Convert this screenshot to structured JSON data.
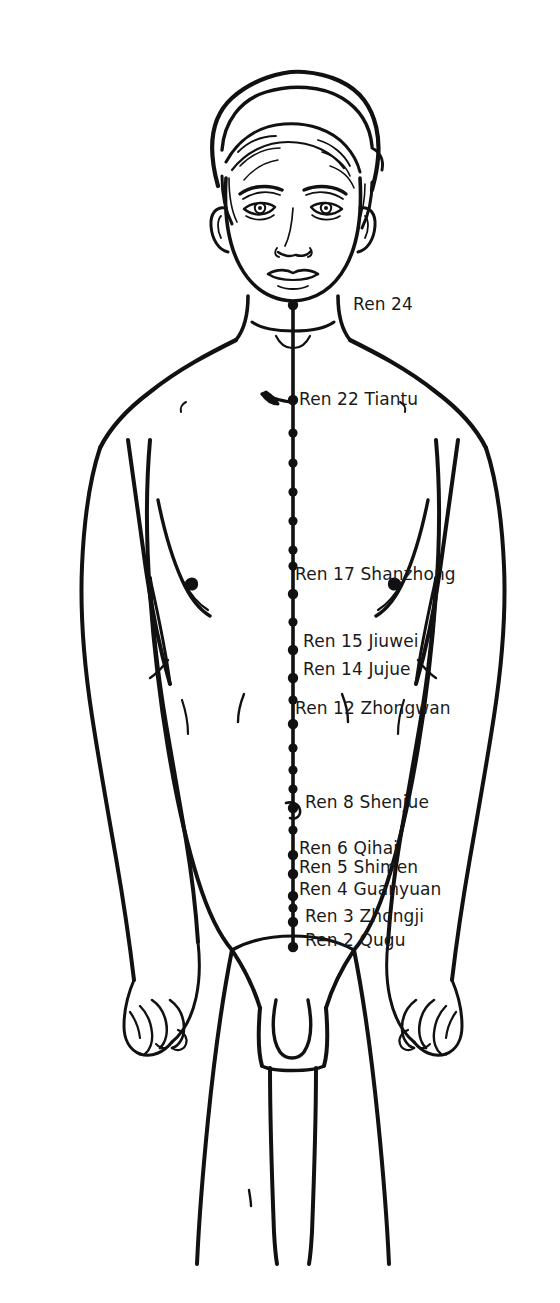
{
  "chart_data": {
    "type": "diagram",
    "meridian": "Ren",
    "background_color": "#ffffff",
    "ink_color": "#111111",
    "midline": {
      "x": 293,
      "y_top": 305,
      "y_bottom": 947,
      "description": "vertical Ren meridian line running from below the lower lip down the midline of the torso to the pubic bone"
    },
    "labeled_points": [
      {
        "id": "ren24",
        "label": "Ren 24",
        "number": 24,
        "name": "",
        "dot_x": 293,
        "dot_y": 305,
        "label_x": 353,
        "label_y": 296
      },
      {
        "id": "ren22",
        "label": "Ren 22 Tiantu",
        "number": 22,
        "name": "Tiantu",
        "dot_x": 293,
        "dot_y": 400,
        "label_x": 299,
        "label_y": 391
      },
      {
        "id": "ren17",
        "label": "Ren 17 Shanzhong",
        "number": 17,
        "name": "Shanzhong",
        "dot_x": 293,
        "dot_y": 594,
        "label_x": 295,
        "label_y": 566
      },
      {
        "id": "ren15",
        "label": "Ren 15 Jiuwei",
        "number": 15,
        "name": "Jiuwei",
        "dot_x": 293,
        "dot_y": 650,
        "label_x": 303,
        "label_y": 633
      },
      {
        "id": "ren14",
        "label": "Ren 14 Jujue",
        "number": 14,
        "name": "Jujue",
        "dot_x": 293,
        "dot_y": 678,
        "label_x": 303,
        "label_y": 661
      },
      {
        "id": "ren12",
        "label": "Ren 12 Zhongwan",
        "number": 12,
        "name": "Zhongwan",
        "dot_x": 293,
        "dot_y": 724,
        "label_x": 295,
        "label_y": 700
      },
      {
        "id": "ren8",
        "label": "Ren 8 Shenjue",
        "number": 8,
        "name": "Shenjue",
        "dot_x": 293,
        "dot_y": 808,
        "label_x": 305,
        "label_y": 794
      },
      {
        "id": "ren6",
        "label": "Ren 6 Qihai",
        "number": 6,
        "name": "Qihai",
        "dot_x": 293,
        "dot_y": 855,
        "label_x": 299,
        "label_y": 840
      },
      {
        "id": "ren5",
        "label": "Ren 5 Shimen",
        "number": 5,
        "name": "Shimen",
        "dot_x": 293,
        "dot_y": 874,
        "label_x": 299,
        "label_y": 859
      },
      {
        "id": "ren4",
        "label": "Ren 4 Guanyuan",
        "number": 4,
        "name": "Guanyuan",
        "dot_x": 293,
        "dot_y": 896,
        "label_x": 299,
        "label_y": 881
      },
      {
        "id": "ren3",
        "label": "Ren 3 Zhongji",
        "number": 3,
        "name": "Zhongji",
        "dot_x": 293,
        "dot_y": 922,
        "label_x": 305,
        "label_y": 908
      },
      {
        "id": "ren2",
        "label": "Ren 2 Qugu",
        "number": 2,
        "name": "Qugu",
        "dot_x": 293,
        "dot_y": 947,
        "label_x": 305,
        "label_y": 932
      }
    ],
    "unlabeled_point_dots_y": [
      433,
      463,
      492,
      521,
      550,
      566,
      622,
      700,
      748,
      770,
      789,
      830,
      908
    ],
    "leader_arrows": [
      {
        "for": "ren22",
        "from_x": 262,
        "from_y": 396,
        "to_x": 290,
        "to_y": 401
      },
      {
        "for": "ren8",
        "from_x": 283,
        "from_y": 805,
        "to_x": 295,
        "to_y": 810
      }
    ]
  },
  "figure": {
    "features": [
      "head",
      "face",
      "ears",
      "hair",
      "neck",
      "shoulders",
      "arms",
      "hands",
      "chest",
      "nipples",
      "navel",
      "groin",
      "legs"
    ]
  }
}
